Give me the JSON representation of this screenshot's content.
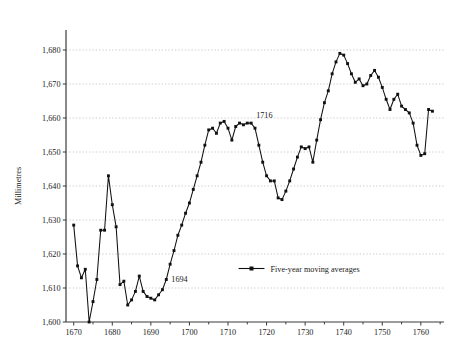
{
  "chart_data": {
    "type": "line",
    "title": "",
    "xlabel": "",
    "ylabel": "Millimetres",
    "xlim": [
      1668,
      1766
    ],
    "ylim": [
      1600,
      1684
    ],
    "grid": true,
    "grid_axis": "y",
    "legend_position": "inside-center-bottom",
    "y_ticks": [
      1600,
      1610,
      1620,
      1630,
      1640,
      1650,
      1660,
      1670,
      1680
    ],
    "y_tick_labels": [
      "1,600",
      "1,610",
      "1,620",
      "1,630",
      "1,640",
      "1,650",
      "1,660",
      "1,670",
      "1,680"
    ],
    "x_ticks": [
      1670,
      1680,
      1690,
      1700,
      1710,
      1720,
      1730,
      1740,
      1750,
      1760
    ],
    "x_tick_labels": [
      "1670",
      "1680",
      "1690",
      "1700",
      "1710",
      "1720",
      "1730",
      "1740",
      "1750",
      "1760"
    ],
    "x_minor_tick_step": 5,
    "annotations": [
      {
        "text": "1694",
        "x": 1694,
        "y": 1612.5,
        "dx": 5,
        "dy": 2.5
      },
      {
        "text": "1716",
        "x": 1716,
        "y": 1659.5,
        "dx": 5,
        "dy": -2.0
      }
    ],
    "series": [
      {
        "name": "Five-year moving averages",
        "marker": "square",
        "color": "#111111",
        "x": [
          1670,
          1671,
          1672,
          1673,
          1674,
          1675,
          1676,
          1677,
          1678,
          1679,
          1680,
          1681,
          1682,
          1683,
          1684,
          1685,
          1686,
          1687,
          1688,
          1689,
          1690,
          1691,
          1692,
          1693,
          1694,
          1695,
          1696,
          1697,
          1698,
          1699,
          1700,
          1701,
          1702,
          1703,
          1704,
          1705,
          1706,
          1707,
          1708,
          1709,
          1710,
          1711,
          1712,
          1713,
          1714,
          1715,
          1716,
          1717,
          1718,
          1719,
          1720,
          1721,
          1722,
          1723,
          1724,
          1725,
          1726,
          1727,
          1728,
          1729,
          1730,
          1731,
          1732,
          1733,
          1734,
          1735,
          1736,
          1737,
          1738,
          1739,
          1740,
          1741,
          1742,
          1743,
          1744,
          1745,
          1746,
          1747,
          1748,
          1749,
          1750,
          1751,
          1752,
          1753,
          1754,
          1755,
          1756,
          1757,
          1758,
          1759,
          1760,
          1761,
          1762,
          1763
        ],
        "values": [
          1628.5,
          1616.5,
          1613.0,
          1615.5,
          1600.0,
          1606.0,
          1612.5,
          1627.0,
          1627.0,
          1643.0,
          1634.5,
          1628.0,
          1611.0,
          1612.0,
          1605.0,
          1606.5,
          1609.0,
          1613.5,
          1609.0,
          1607.5,
          1607.0,
          1606.5,
          1608.0,
          1609.5,
          1612.5,
          1617.0,
          1621.0,
          1625.5,
          1628.5,
          1632.0,
          1635.0,
          1639.0,
          1643.0,
          1647.0,
          1652.0,
          1656.5,
          1657.0,
          1655.5,
          1658.5,
          1659.0,
          1657.0,
          1653.5,
          1657.5,
          1658.5,
          1658.0,
          1658.5,
          1658.5,
          1657.0,
          1652.0,
          1647.0,
          1643.0,
          1641.5,
          1641.5,
          1636.5,
          1636.0,
          1638.5,
          1641.5,
          1645.0,
          1648.5,
          1651.5,
          1651.0,
          1651.5,
          1647.0,
          1653.5,
          1659.5,
          1664.5,
          1668.0,
          1673.0,
          1676.5,
          1679.0,
          1678.5,
          1676.0,
          1673.0,
          1670.5,
          1671.5,
          1669.5,
          1670.0,
          1672.5,
          1674.0,
          1672.0,
          1669.0,
          1665.5,
          1662.5,
          1665.5,
          1667.0,
          1663.5,
          1662.5,
          1661.5,
          1658.5,
          1652.0,
          1649.0,
          1649.5,
          1662.5,
          1662.0
        ]
      }
    ]
  },
  "legend": {
    "entries": [
      {
        "label": "Five-year moving averages"
      }
    ]
  }
}
